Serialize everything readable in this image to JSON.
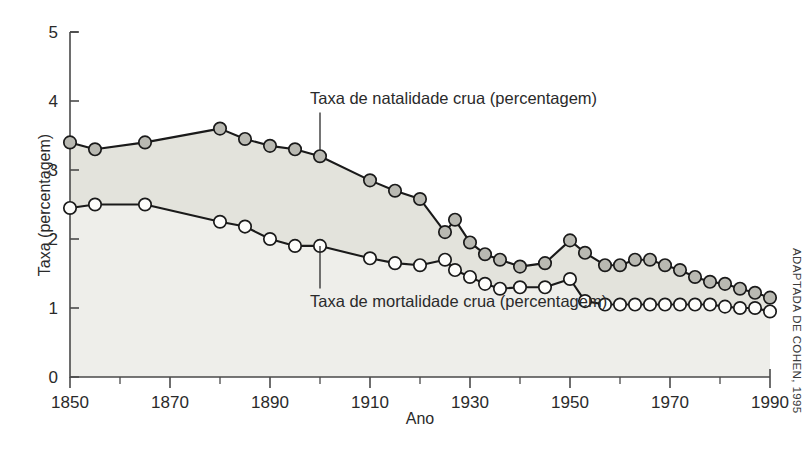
{
  "credit": "ADAPTADA DE COHEN, 1995",
  "chart_data": {
    "type": "line",
    "title": "",
    "subtitle": "",
    "xlabel": "Ano",
    "ylabel": "Taxa (percentagem)",
    "xlim": [
      1850,
      1990
    ],
    "ylim": [
      0,
      5
    ],
    "xticks": [
      1850,
      1870,
      1890,
      1910,
      1930,
      1950,
      1970,
      1990
    ],
    "xtick_labels": [
      "1850",
      "1870",
      "1890",
      "1910",
      "1930",
      "1950",
      "1970",
      "1990"
    ],
    "xminor_ticks": [
      1860,
      1880,
      1900,
      1920,
      1940,
      1960,
      1980
    ],
    "yticks": [
      0,
      1,
      2,
      3,
      4,
      5
    ],
    "ytick_labels": [
      "0",
      "1",
      "2",
      "3",
      "4",
      "5"
    ],
    "grid": false,
    "legend_position": "inline-annotations",
    "fill_between": true,
    "fill_color": "#e3e3dc",
    "under_fill_color": "#eeeeea",
    "annotations": [
      {
        "text": "Taxa de natalidade crua (percentagem)",
        "series": "natalidade",
        "x": 1900,
        "y": 3.28,
        "text_x": 1900,
        "text_y": 3.95
      },
      {
        "text": "Taxa de mortalidade crua (percentagem)",
        "series": "mortalidade",
        "x": 1900,
        "y": 1.9,
        "text_x": 1900,
        "text_y": 1.02
      }
    ],
    "series": [
      {
        "name": "Taxa de natalidade crua (percentagem)",
        "marker": "filled-circle",
        "marker_color": "#b9b9b2",
        "line_color": "#1a1a1a",
        "x": [
          1850,
          1855,
          1865,
          1880,
          1885,
          1890,
          1895,
          1900,
          1910,
          1915,
          1920,
          1925,
          1927,
          1930,
          1933,
          1936,
          1940,
          1945,
          1950,
          1953,
          1957,
          1960,
          1963,
          1966,
          1969,
          1972,
          1975,
          1978,
          1981,
          1984,
          1987,
          1990
        ],
        "values": [
          3.4,
          3.3,
          3.4,
          3.6,
          3.45,
          3.35,
          3.3,
          3.2,
          2.85,
          2.7,
          2.58,
          2.1,
          2.28,
          1.95,
          1.78,
          1.7,
          1.6,
          1.65,
          1.98,
          1.8,
          1.62,
          1.62,
          1.7,
          1.7,
          1.62,
          1.55,
          1.45,
          1.38,
          1.35,
          1.28,
          1.22,
          1.15
        ]
      },
      {
        "name": "Taxa de mortalidade crua (percentagem)",
        "marker": "open-circle",
        "marker_color": "#fdfdfb",
        "line_color": "#1a1a1a",
        "x": [
          1850,
          1855,
          1865,
          1880,
          1885,
          1890,
          1895,
          1900,
          1910,
          1915,
          1920,
          1925,
          1927,
          1930,
          1933,
          1936,
          1940,
          1945,
          1950,
          1953,
          1957,
          1960,
          1963,
          1966,
          1969,
          1972,
          1975,
          1978,
          1981,
          1984,
          1987,
          1990
        ],
        "values": [
          2.45,
          2.5,
          2.5,
          2.25,
          2.18,
          2.0,
          1.9,
          1.9,
          1.72,
          1.65,
          1.62,
          1.7,
          1.55,
          1.45,
          1.35,
          1.28,
          1.3,
          1.3,
          1.42,
          1.1,
          1.05,
          1.05,
          1.05,
          1.05,
          1.05,
          1.05,
          1.05,
          1.05,
          1.02,
          1.0,
          1.0,
          0.95
        ]
      }
    ]
  }
}
